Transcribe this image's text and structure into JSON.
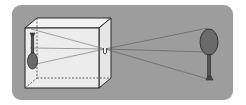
{
  "diagram": {
    "type": "pinhole-camera",
    "colors": {
      "page_background": "#ffffff",
      "panel": "#9d9d9d",
      "box_front": "#ececec",
      "box_side": "#e4e4e4",
      "box_top": "#f2f2f2",
      "box_edge": "#1e1e1e",
      "ray": "#555555",
      "object_fill": "#6a6a6a",
      "object_stroke": "#2a2a2a"
    },
    "elements": [
      {
        "name": "camera-box",
        "description": "translucent cube representing the camera body"
      },
      {
        "name": "pinhole",
        "description": "small aperture on the right face of the box"
      },
      {
        "name": "inverted-image",
        "description": "upside-down image of the object on the back wall"
      },
      {
        "name": "object",
        "description": "upright lollipop-shaped object outside the box"
      },
      {
        "name": "light-rays",
        "count": 3
      }
    ]
  }
}
